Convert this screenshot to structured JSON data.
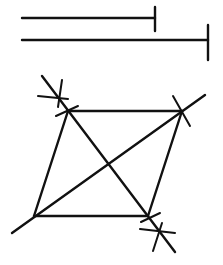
{
  "figure": {
    "stroke_color": "#111111",
    "background": "#ffffff",
    "given_segments": [
      {
        "name": "segment-short",
        "x1": 22,
        "y1": 18,
        "x2": 155,
        "y2": 18,
        "tick": {
          "x": 155,
          "y1": 7,
          "y2": 31
        }
      },
      {
        "name": "segment-long",
        "x1": 22,
        "y1": 40,
        "x2": 208,
        "y2": 40,
        "tick": {
          "x": 208,
          "y1": 25,
          "y2": 60
        }
      }
    ],
    "vertices": {
      "A": {
        "x": 68,
        "y": 111
      },
      "B": {
        "x": 182,
        "y": 111
      },
      "C": {
        "x": 148,
        "y": 216
      },
      "D": {
        "x": 34,
        "y": 216
      }
    },
    "diagonals": [
      {
        "name": "diagonal-db",
        "x1": 12,
        "y1": 233,
        "x2": 205,
        "y2": 95
      },
      {
        "name": "diagonal-ac",
        "x1": 42,
        "y1": 76,
        "x2": 175,
        "y2": 252
      }
    ],
    "arc_marks": [
      {
        "name": "arc-mark-top-left-1",
        "x1": 38,
        "y1": 96,
        "x2": 68,
        "y2": 99
      },
      {
        "name": "arc-mark-top-left-2",
        "x1": 62,
        "y1": 80,
        "x2": 58,
        "y2": 107
      },
      {
        "name": "arc-mark-top-left-3",
        "x1": 56,
        "y1": 116,
        "x2": 78,
        "y2": 106
      },
      {
        "name": "arc-mark-top-right",
        "x1": 173,
        "y1": 96,
        "x2": 190,
        "y2": 126
      },
      {
        "name": "arc-mark-bottom-right-1",
        "x1": 141,
        "y1": 222,
        "x2": 160,
        "y2": 213
      },
      {
        "name": "arc-mark-bottom-right-2",
        "x1": 140,
        "y1": 229,
        "x2": 175,
        "y2": 233
      },
      {
        "name": "arc-mark-bottom-right-3",
        "x1": 162,
        "y1": 223,
        "x2": 153,
        "y2": 251
      }
    ]
  }
}
